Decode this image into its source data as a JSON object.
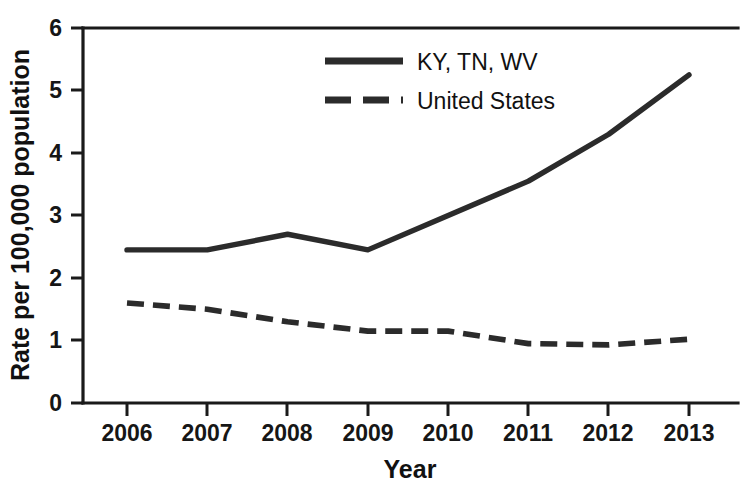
{
  "chart_data": {
    "type": "line",
    "title": "",
    "subtitle": "",
    "xlabel": "Year",
    "ylabel": "Rate per 100,000 population",
    "x": [
      2006,
      2007,
      2008,
      2009,
      2010,
      2011,
      2012,
      2013
    ],
    "categories": [
      "2006",
      "2007",
      "2008",
      "2009",
      "2010",
      "2011",
      "2012",
      "2013"
    ],
    "xlim": [
      2006,
      2013
    ],
    "ylim": [
      0,
      6
    ],
    "yticks": [
      0,
      1,
      2,
      3,
      4,
      5,
      6
    ],
    "yticklabels": [
      "0",
      "1",
      "2",
      "3",
      "4",
      "5",
      "6"
    ],
    "grid": false,
    "legend_position": "top-center",
    "series": [
      {
        "name": "KY, TN, WV",
        "style": "solid",
        "color": "#2b2b2b",
        "values": [
          2.45,
          2.45,
          2.7,
          2.45,
          3.0,
          3.55,
          4.3,
          5.25
        ]
      },
      {
        "name": "United States",
        "style": "dashed",
        "color": "#2b2b2b",
        "values": [
          1.6,
          1.5,
          1.3,
          1.15,
          1.15,
          0.95,
          0.93,
          1.02
        ]
      }
    ],
    "annotations": []
  },
  "legend": {
    "entries": [
      {
        "label": "KY, TN, WV",
        "style": "solid"
      },
      {
        "label": "United States",
        "style": "dashed"
      }
    ]
  },
  "axes": {
    "y_title": "Rate per 100,000 population",
    "x_title": "Year",
    "y_tick_labels": [
      "6",
      "5",
      "4",
      "3",
      "2",
      "1",
      "0"
    ],
    "x_tick_labels": [
      "2006",
      "2007",
      "2008",
      "2009",
      "2010",
      "2011",
      "2012",
      "2013"
    ]
  },
  "colors": {
    "line": "#2b2b2b",
    "axis": "#1a1a1a",
    "background": "#ffffff",
    "text": "#111111"
  }
}
